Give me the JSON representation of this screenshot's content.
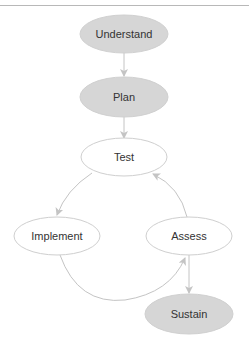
{
  "diagram": {
    "type": "flow",
    "colors": {
      "filled_node": "#d6d6d6",
      "outline_node_fill": "#ffffff",
      "node_stroke": "#cfcfcf",
      "edge": "#c4c4c4",
      "text": "#333333"
    },
    "nodes": [
      {
        "id": "understand",
        "label": "Understand",
        "style": "filled"
      },
      {
        "id": "plan",
        "label": "Plan",
        "style": "filled"
      },
      {
        "id": "test",
        "label": "Test",
        "style": "outline"
      },
      {
        "id": "implement",
        "label": "Implement",
        "style": "outline"
      },
      {
        "id": "assess",
        "label": "Assess",
        "style": "outline"
      },
      {
        "id": "sustain",
        "label": "Sustain",
        "style": "filled"
      }
    ],
    "edges": [
      {
        "from": "understand",
        "to": "plan"
      },
      {
        "from": "plan",
        "to": "test"
      },
      {
        "from": "test",
        "to": "implement"
      },
      {
        "from": "implement",
        "to": "assess"
      },
      {
        "from": "assess",
        "to": "test"
      },
      {
        "from": "assess",
        "to": "sustain"
      }
    ]
  }
}
